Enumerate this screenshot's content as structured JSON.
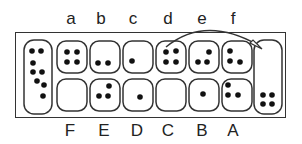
{
  "top_labels": [
    "a",
    "b",
    "c",
    "d",
    "e",
    "f"
  ],
  "bottom_labels": [
    "F",
    "E",
    "D",
    "C",
    "B",
    "A"
  ],
  "left_store": {
    "seeds": 8
  },
  "right_store": {
    "seeds": 4
  },
  "top_pits": [
    {
      "label": "a",
      "seeds": 4
    },
    {
      "label": "b",
      "seeds": 2
    },
    {
      "label": "c",
      "seeds": 1
    },
    {
      "label": "d",
      "seeds": 4
    },
    {
      "label": "e",
      "seeds": 3
    },
    {
      "label": "f",
      "seeds": 3
    }
  ],
  "bottom_pits": [
    {
      "label": "F",
      "seeds": 0
    },
    {
      "label": "E",
      "seeds": 3
    },
    {
      "label": "D",
      "seeds": 1
    },
    {
      "label": "C",
      "seeds": 0
    },
    {
      "label": "B",
      "seeds": 1
    },
    {
      "label": "A",
      "seeds": 3
    }
  ],
  "arrow": {
    "from": "d",
    "to": "right-store"
  },
  "colors": {
    "line": "#333333",
    "seed": "#111111",
    "background": "#ffffff"
  }
}
